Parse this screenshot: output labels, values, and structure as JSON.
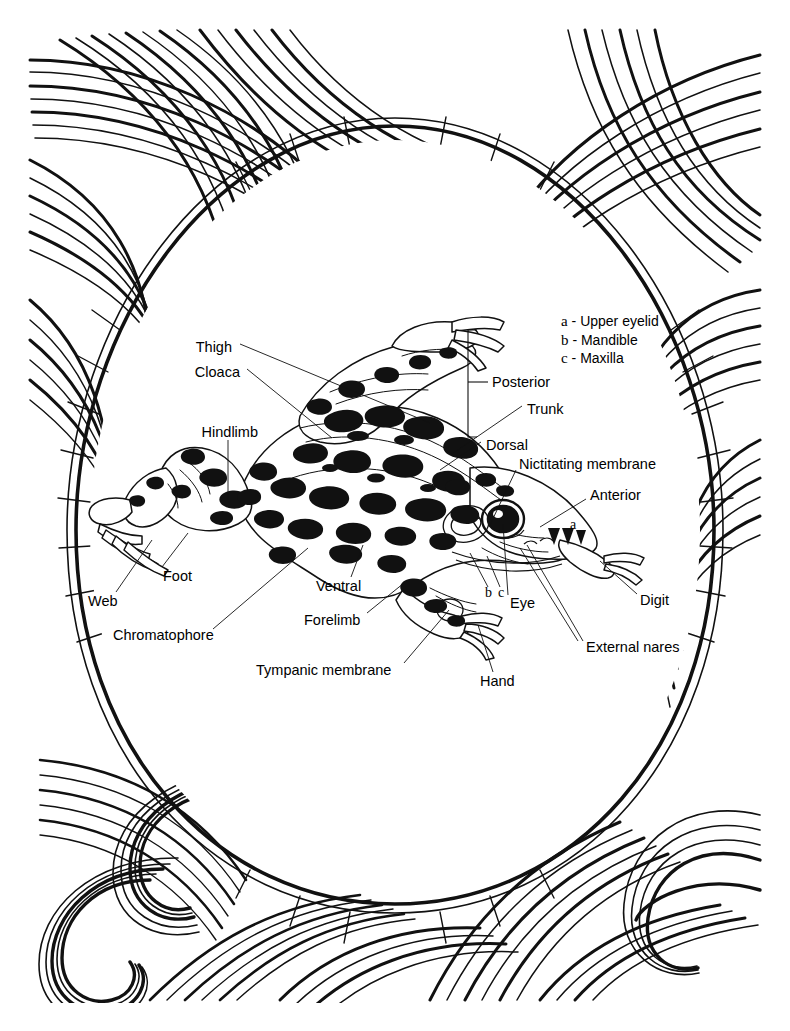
{
  "document": {
    "type": "anatomy-diagram",
    "subject": "Frog external anatomy (leopard frog), dorsolateral view",
    "background": "#ffffff",
    "ink_color": "#000000",
    "border_style": "decorative flowing wavy line pattern with spirals (zentangle)"
  },
  "legend": {
    "items": [
      {
        "key": "a",
        "dash": "-",
        "label": "Upper eyelid"
      },
      {
        "key": "b",
        "dash": "-",
        "label": "Mandible"
      },
      {
        "key": "c",
        "dash": "-",
        "label": "Maxilla"
      }
    ]
  },
  "callouts": [
    {
      "id": "thigh",
      "text": "Thigh",
      "align": "right",
      "x": 232,
      "y": 347,
      "lx": 240,
      "ly": 344,
      "tx": 430,
      "ty": 423
    },
    {
      "id": "cloaca",
      "text": "Cloaca",
      "align": "right",
      "x": 240,
      "y": 372,
      "lx": 247,
      "ly": 369,
      "tx": 332,
      "ty": 438
    },
    {
      "id": "hindlimb",
      "text": "Hindlimb",
      "align": "right",
      "x": 258,
      "y": 432,
      "lx": 228,
      "ly": 440,
      "tx": 228,
      "ty": 500
    },
    {
      "id": "web",
      "text": "Web",
      "align": "left",
      "x": 88,
      "y": 601,
      "lx": 116,
      "ly": 592,
      "tx": 152,
      "ty": 540
    },
    {
      "id": "foot",
      "text": "Foot",
      "align": "left",
      "x": 163,
      "y": 576,
      "lx": 162,
      "ly": 567,
      "tx": 188,
      "ty": 533
    },
    {
      "id": "chromatophore",
      "text": "Chromatophore",
      "align": "left",
      "x": 113,
      "y": 635,
      "lx": 213,
      "ly": 629,
      "tx": 308,
      "ty": 548
    },
    {
      "id": "ventral",
      "text": "Ventral",
      "align": "left",
      "x": 316,
      "y": 586,
      "lx": 351,
      "ly": 577,
      "tx": 363,
      "ty": 545
    },
    {
      "id": "forelimb",
      "text": "Forelimb",
      "align": "left",
      "x": 304,
      "y": 620,
      "lx": 367,
      "ly": 613,
      "tx": 404,
      "ty": 583
    },
    {
      "id": "tympanic-membrane",
      "text": "Tympanic membrane",
      "align": "left",
      "x": 256,
      "y": 670,
      "lx": 404,
      "ly": 663,
      "tx": 449,
      "ty": 610
    },
    {
      "id": "hand",
      "text": "Hand",
      "align": "left",
      "x": 480,
      "y": 681,
      "lx": 493,
      "ly": 672,
      "tx": 478,
      "ty": 625
    },
    {
      "id": "posterior",
      "text": "Posterior",
      "align": "left",
      "x": 492,
      "y": 382,
      "lx": 468,
      "ly": 382,
      "tx": 488,
      "ty": 382
    },
    {
      "id": "trunk",
      "text": "Trunk",
      "align": "left",
      "x": 527,
      "y": 409,
      "lx": 522,
      "ly": 406,
      "tx": 452,
      "ty": 454
    },
    {
      "id": "dorsal",
      "text": "Dorsal",
      "align": "left",
      "x": 486,
      "y": 445,
      "lx": 481,
      "ly": 442,
      "tx": 440,
      "ty": 470
    },
    {
      "id": "nictitating-membrane",
      "text": "Nictitating membrane",
      "align": "left",
      "x": 519,
      "y": 464,
      "lx": 516,
      "ly": 470,
      "tx": 489,
      "ty": 527
    },
    {
      "id": "anterior",
      "text": "Anterior",
      "align": "left",
      "x": 590,
      "y": 495,
      "lx": 586,
      "ly": 499,
      "tx": 540,
      "ty": 527
    },
    {
      "id": "digit",
      "text": "Digit",
      "align": "left",
      "x": 640,
      "y": 600,
      "lx": 637,
      "ly": 594,
      "tx": 600,
      "ty": 561
    },
    {
      "id": "external-nares",
      "text": "External nares",
      "align": "left",
      "x": 586,
      "y": 647,
      "lx": 583,
      "ly": 641,
      "tx": 527,
      "ty": 545
    },
    {
      "id": "eye",
      "text": "Eye",
      "align": "left",
      "x": 510,
      "y": 603,
      "lx": 508,
      "ly": 595,
      "tx": 503,
      "ty": 524
    },
    {
      "id": "b",
      "text": "b",
      "align": "left",
      "x": 487,
      "y": 595,
      "lx": 488,
      "ly": 587,
      "tx": 470,
      "ty": 553
    },
    {
      "id": "c",
      "text": "c",
      "align": "left",
      "x": 499,
      "y": 595,
      "lx": 500,
      "ly": 587,
      "tx": 487,
      "ty": 556
    },
    {
      "id": "a",
      "text": "a",
      "align": "left",
      "x": 570,
      "y": 525,
      "lx": 0,
      "ly": 0,
      "tx": 0,
      "ty": 0
    }
  ],
  "bracket": {
    "id": "posterior-bracket",
    "x": 468,
    "top": 330,
    "bottom": 437,
    "tick_y": 382,
    "arm": 9
  }
}
